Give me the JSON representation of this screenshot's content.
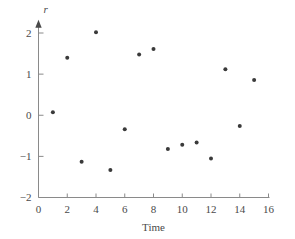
{
  "chart_data": {
    "type": "scatter",
    "title": "",
    "xlabel": "Time",
    "ylabel": "r",
    "ylabel_style": "italic",
    "xlim": [
      0,
      16
    ],
    "ylim": [
      -2,
      2.3
    ],
    "xticks": [
      0,
      2,
      4,
      6,
      8,
      10,
      12,
      14,
      16
    ],
    "xtick_labels": [
      "0",
      "2",
      "4",
      "6",
      "8",
      "10",
      "12",
      "14",
      "16"
    ],
    "yticks": [
      2,
      1,
      0,
      -1,
      -2
    ],
    "ytick_labels": [
      "2",
      "1",
      "0",
      "−1",
      "−2"
    ],
    "grid": false,
    "legend": null,
    "marker": "circle",
    "marker_color": "#3a3a3a",
    "marker_size": 4,
    "axis_color": "#8a8a8a",
    "text_color": "#4a4a4a",
    "background_color": "#ffffff",
    "y_axis_has_arrow": true,
    "x": [
      1,
      2,
      3,
      4,
      5,
      6,
      7,
      8,
      9,
      10,
      11,
      12,
      13,
      14,
      15
    ],
    "y": [
      0.07,
      1.4,
      -1.13,
      2.02,
      -1.33,
      -0.34,
      1.48,
      1.61,
      -0.82,
      -0.72,
      -0.66,
      -1.05,
      1.12,
      -0.26,
      0.86
    ],
    "points": [
      {
        "x": 1,
        "y": 0.07
      },
      {
        "x": 2,
        "y": 1.4
      },
      {
        "x": 3,
        "y": -1.13
      },
      {
        "x": 4,
        "y": 2.02
      },
      {
        "x": 5,
        "y": -1.33
      },
      {
        "x": 6,
        "y": -0.34
      },
      {
        "x": 7,
        "y": 1.48
      },
      {
        "x": 8,
        "y": 1.61
      },
      {
        "x": 9,
        "y": -0.82
      },
      {
        "x": 10,
        "y": -0.72
      },
      {
        "x": 11,
        "y": -0.66
      },
      {
        "x": 12,
        "y": -1.05
      },
      {
        "x": 13,
        "y": 1.12
      },
      {
        "x": 14,
        "y": -0.26
      },
      {
        "x": 15,
        "y": 0.86
      }
    ]
  }
}
